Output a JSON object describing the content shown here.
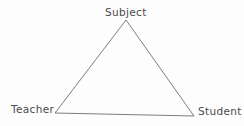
{
  "diagram": {
    "kind": "triangle-diagram",
    "name": "didactic-triangle",
    "background_color": "#fdfdfd",
    "stroke_color": "#7d7d7d",
    "text_color": "#4a4a4a",
    "stroke_width": 1,
    "filled": false,
    "width": 244,
    "height": 126,
    "vertices": [
      {
        "id": "apex",
        "label": "Subject",
        "x": 126,
        "y": 20,
        "label_position": "above"
      },
      {
        "id": "bottom-left",
        "label": "Teacher",
        "x": 55,
        "y": 113,
        "label_position": "left"
      },
      {
        "id": "bottom-right",
        "label": "Student",
        "x": 194,
        "y": 116,
        "label_position": "right"
      }
    ],
    "edges": [
      {
        "id": "left-edge",
        "from": "apex",
        "to": "bottom-left"
      },
      {
        "id": "right-edge",
        "from": "apex",
        "to": "bottom-right"
      },
      {
        "id": "base-edge",
        "from": "bottom-left",
        "to": "bottom-right"
      }
    ],
    "path": "M 126 20 L 55 113 L 194 116 Z"
  }
}
